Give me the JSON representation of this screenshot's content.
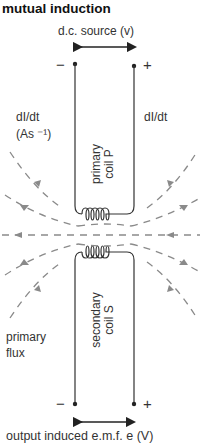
{
  "title": "mutual induction",
  "source_label": "d.c. source (v)",
  "output_label": "output induced e.m.f. e (V)",
  "primary_coil": {
    "line1": "primary",
    "line2": "coil P"
  },
  "secondary_coil": {
    "line1": "secondary",
    "line2": "coil S"
  },
  "left_rate_label": {
    "line1": "dI/dt",
    "line2": "(As ⁻¹)"
  },
  "right_rate_label": "dI/dt",
  "flux_label": {
    "line1": "primary",
    "line2": "flux"
  },
  "terminals": {
    "minus": "−",
    "plus": "+"
  },
  "colors": {
    "wire": "#333333",
    "flux": "#8a8a8a",
    "text": "#333333"
  }
}
